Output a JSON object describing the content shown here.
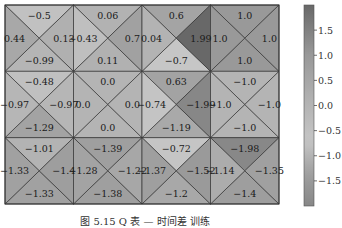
{
  "chart_data": {
    "type": "heatmap",
    "subtype": "quadrant-triangle heatmap",
    "rows": 3,
    "cols": 4,
    "triangle_order": [
      "top",
      "left",
      "right",
      "bottom"
    ],
    "cells": [
      [
        {
          "top": -0.5,
          "left": 0.44,
          "right": 0.13,
          "bottom": -0.99
        },
        {
          "top": 0.06,
          "left": -0.43,
          "right": 0.7,
          "bottom": 0.11
        },
        {
          "top": 0.6,
          "left": 0.04,
          "right": 1.99,
          "bottom": -0.7
        },
        {
          "top": 1.0,
          "left": 1.0,
          "right": 1.0,
          "bottom": 1.0
        }
      ],
      [
        {
          "top": -0.48,
          "left": -0.97,
          "right": -0.97,
          "bottom": -1.29
        },
        {
          "top": 0.0,
          "left": 0.0,
          "right": 0.0,
          "bottom": 0.0
        },
        {
          "top": 0.63,
          "left": -0.74,
          "right": -1.99,
          "bottom": -1.19
        },
        {
          "top": -1.0,
          "left": -1.0,
          "right": -1.0,
          "bottom": -1.0
        }
      ],
      [
        {
          "top": -1.01,
          "left": -1.33,
          "right": -1.4,
          "bottom": -1.33
        },
        {
          "top": -1.39,
          "left": -1.28,
          "right": -1.22,
          "bottom": -1.38
        },
        {
          "top": -0.72,
          "left": -1.37,
          "right": -1.52,
          "bottom": -1.2
        },
        {
          "top": -1.98,
          "left": -1.14,
          "right": -1.35,
          "bottom": -1.4
        }
      ]
    ],
    "colorbar": {
      "ticks": [
        1.5,
        1.0,
        0.5,
        0.0,
        -0.5,
        -1.0,
        -1.5
      ],
      "tick_labels": [
        "1.5",
        "1.0",
        "0.5",
        "0.0",
        "−0.5",
        "−1.0",
        "−1.5"
      ],
      "vmin": -2.0,
      "vmax": 2.0
    },
    "colormap_stops": [
      {
        "v": -2.0,
        "color": "#878787"
      },
      {
        "v": -1.3,
        "color": "#a2a2a2"
      },
      {
        "v": -0.7,
        "color": "#c6c6c6"
      },
      {
        "v": 0.0,
        "color": "#b4b4b4"
      },
      {
        "v": 1.0,
        "color": "#999999"
      },
      {
        "v": 2.0,
        "color": "#686868"
      }
    ],
    "title": "",
    "xlabel": "",
    "ylabel": "",
    "grid": true,
    "legend": "colorbar right"
  },
  "caption": "图 5.15   Q 表 — 时间差 训练"
}
